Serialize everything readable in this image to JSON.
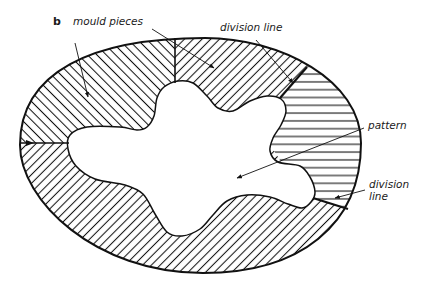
{
  "figure": {
    "panel_letter": "b",
    "labels": {
      "mould_pieces": "mould pieces",
      "division_line_top": "division line",
      "pattern": "pattern",
      "division_line_bottom_1": "division",
      "division_line_bottom_2": "line"
    },
    "regions": [
      {
        "name": "upper-left mould piece",
        "hatch": "diagonal-back"
      },
      {
        "name": "top mould piece",
        "hatch": "diagonal-forward"
      },
      {
        "name": "right mould piece",
        "hatch": "horizontal"
      },
      {
        "name": "lower mould piece",
        "hatch": "diagonal-forward"
      }
    ],
    "colors": {
      "ink": "#111111",
      "background": "#ffffff"
    }
  }
}
